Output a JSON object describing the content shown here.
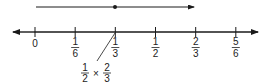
{
  "diagram": {
    "type": "number-line",
    "colors": {
      "ink": "#1a1a1a"
    },
    "top_segment": {
      "start_value": 0,
      "point_value": "1/3",
      "end_value": "2/3",
      "description": "arrow from 0 to 2/3 with point marked at 1/3"
    },
    "ticks": [
      {
        "value": 0,
        "num": "0",
        "den": ""
      },
      {
        "value": 0.1667,
        "num": "1",
        "den": "6"
      },
      {
        "value": 0.3333,
        "num": "1",
        "den": "3"
      },
      {
        "value": 0.5,
        "num": "1",
        "den": "2"
      },
      {
        "value": 0.6667,
        "num": "2",
        "den": "3"
      },
      {
        "value": 0.8333,
        "num": "5",
        "den": "6"
      }
    ],
    "annotation": {
      "points_to": "1/3",
      "left_num": "1",
      "left_den": "2",
      "operator": "×",
      "right_num": "2",
      "right_den": "3"
    }
  }
}
